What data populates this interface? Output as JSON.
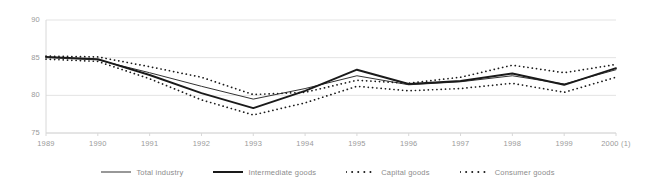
{
  "chart_data": {
    "type": "line",
    "title": "",
    "xlabel": "",
    "ylabel": "",
    "grid": true,
    "legend_position": "bottom",
    "ylim": [
      75,
      90
    ],
    "yticks": [
      75,
      80,
      85,
      90
    ],
    "categories": [
      "1989",
      "1990",
      "1991",
      "1992",
      "1993",
      "1994",
      "1995",
      "1996",
      "1997",
      "1998",
      "1999",
      "2000 (1)"
    ],
    "series": [
      {
        "name": "Total industry",
        "style": "solid-thin",
        "color": "#333333",
        "values": [
          85.0,
          84.7,
          83.0,
          81.2,
          79.5,
          80.9,
          82.6,
          81.4,
          81.8,
          82.6,
          81.5,
          83.4
        ]
      },
      {
        "name": "Intermediate goods",
        "style": "solid-thick",
        "color": "#1a1a1a",
        "values": [
          85.1,
          84.8,
          82.7,
          80.3,
          78.3,
          80.6,
          83.4,
          81.5,
          81.9,
          82.9,
          81.4,
          83.6
        ]
      },
      {
        "name": "Capital goods",
        "style": "dotted",
        "color": "#1a1a1a",
        "values": [
          85.2,
          85.1,
          83.8,
          82.4,
          80.1,
          80.4,
          82.0,
          81.6,
          82.4,
          84.0,
          83.0,
          84.1
        ]
      },
      {
        "name": "Consumer goods",
        "style": "dotted",
        "color": "#1a1a1a",
        "values": [
          84.8,
          84.5,
          82.2,
          79.4,
          77.4,
          79.0,
          81.2,
          80.6,
          80.9,
          81.6,
          80.4,
          82.4
        ]
      }
    ],
    "footnote_marker": "(1)"
  },
  "axes": {
    "y_tick_labels": [
      "90",
      "85",
      "80",
      "75"
    ],
    "x_tick_labels": [
      "1989",
      "1990",
      "1991",
      "1992",
      "1993",
      "1994",
      "1995",
      "1996",
      "1997",
      "1998",
      "1999",
      "2000 (1)"
    ]
  },
  "legend": {
    "items": [
      {
        "label": "Total industry",
        "style": "solid-thin"
      },
      {
        "label": "Intermediate goods",
        "style": "solid-thick"
      },
      {
        "label": "Capital goods",
        "style": "dotted"
      },
      {
        "label": "Consumer goods",
        "style": "dotted"
      }
    ]
  },
  "colors": {
    "background": "#ffffff",
    "grid": "#e3e3e3",
    "axis": "#d8d8d8",
    "tick_text": "#9a9a9a",
    "legend_text": "#8c8c8c",
    "line_dark": "#1a1a1a",
    "line_mid": "#333333"
  }
}
